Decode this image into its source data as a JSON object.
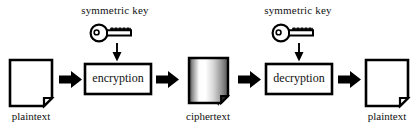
{
  "diagram": {
    "colors": {
      "stroke": "#000000",
      "fill": "#ffffff",
      "text": "#111111",
      "cipher_dark": "#3a3a3a",
      "cipher_light": "#ffffff"
    },
    "keys": [
      {
        "label": "symmetric key",
        "icon": "key-icon",
        "x": 115,
        "y": 12
      },
      {
        "label": "symmetric key",
        "icon": "key-icon",
        "x": 298,
        "y": 12
      }
    ],
    "nodes": [
      {
        "id": "plaintext-in",
        "label": "plaintext",
        "shape": "document",
        "x": 31,
        "y": 82
      },
      {
        "id": "encryption",
        "label": "encryption",
        "shape": "box",
        "x": 118,
        "y": 78
      },
      {
        "id": "ciphertext",
        "label": "ciphertext",
        "shape": "document-gradient",
        "x": 207,
        "y": 82
      },
      {
        "id": "decryption",
        "label": "decryption",
        "shape": "box",
        "x": 299,
        "y": 78
      },
      {
        "id": "plaintext-out",
        "label": "plaintext",
        "shape": "document",
        "x": 385,
        "y": 82
      }
    ],
    "flow_arrows": [
      {
        "from": "plaintext-in",
        "to": "encryption",
        "direction": "right"
      },
      {
        "from": "encryption",
        "to": "ciphertext",
        "direction": "right"
      },
      {
        "from": "ciphertext",
        "to": "decryption",
        "direction": "right"
      },
      {
        "from": "decryption",
        "to": "plaintext-out",
        "direction": "right"
      }
    ],
    "key_arrows": [
      {
        "to": "encryption",
        "direction": "down"
      },
      {
        "to": "decryption",
        "direction": "down"
      }
    ]
  }
}
